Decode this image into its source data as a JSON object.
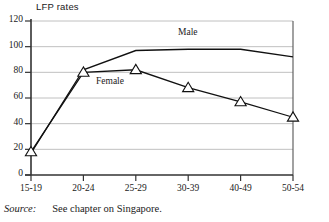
{
  "figure": {
    "axis_title": "LFP rates",
    "source_label": "Source:",
    "source_text": "See chapter on Singapore."
  },
  "labels": {
    "male": "Male",
    "female": "Female"
  },
  "chart_data": {
    "type": "line",
    "title": "LFP rates",
    "xlabel": "",
    "ylabel": "LFP rates",
    "ylim": [
      0,
      120
    ],
    "ytick_values": [
      0,
      20,
      40,
      60,
      80,
      100,
      120
    ],
    "ytick_labels": [
      "0",
      "20",
      "40",
      "60",
      "80",
      "100",
      "120"
    ],
    "grid": "horizontal",
    "legend": "inline-annotation",
    "categories": [
      "15-19",
      "20-24",
      "25-29",
      "30-39",
      "40-49",
      "50-54"
    ],
    "series": [
      {
        "name": "Male",
        "marker": "none",
        "values": [
          17,
          82,
          97,
          98,
          98,
          92
        ]
      },
      {
        "name": "Female",
        "marker": "triangle",
        "values": [
          18,
          80,
          82,
          68,
          57,
          45
        ]
      }
    ]
  }
}
